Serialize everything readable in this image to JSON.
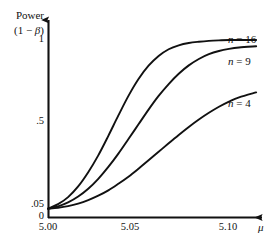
{
  "chart_data": {
    "type": "line",
    "title": "",
    "ylabel": "Power (1 − β)",
    "ylabel_line1": "Power",
    "ylabel_line2_open": "(1 − ",
    "ylabel_line2_var": "β",
    "ylabel_line2_close": ")",
    "xlabel": "μ",
    "xlim": [
      5.0,
      5.1064
    ],
    "ylim": [
      0,
      1.06
    ],
    "grid": false,
    "legend_position": "right-of-curve-ends",
    "yticks": [
      {
        "value": 1,
        "label": "1"
      },
      {
        "value": 0.5,
        "label": ".5"
      },
      {
        "value": 0.05,
        "label": ".05"
      },
      {
        "value": 0,
        "label": "0"
      }
    ],
    "xticks": [
      {
        "value": 5.0,
        "label": "5.00"
      },
      {
        "value": 5.05,
        "label": "5.05"
      },
      {
        "value": 5.1,
        "label": "5.10"
      }
    ],
    "series": [
      {
        "name": "n = 16",
        "label_n": "n",
        "label_eq": "= 16",
        "color": "#111111",
        "points": [
          {
            "x": 5.0,
            "y": 0.05
          },
          {
            "x": 5.005,
            "y": 0.075
          },
          {
            "x": 5.01,
            "y": 0.115
          },
          {
            "x": 5.015,
            "y": 0.175
          },
          {
            "x": 5.02,
            "y": 0.255
          },
          {
            "x": 5.025,
            "y": 0.35
          },
          {
            "x": 5.03,
            "y": 0.46
          },
          {
            "x": 5.035,
            "y": 0.575
          },
          {
            "x": 5.04,
            "y": 0.685
          },
          {
            "x": 5.045,
            "y": 0.78
          },
          {
            "x": 5.05,
            "y": 0.855
          },
          {
            "x": 5.055,
            "y": 0.91
          },
          {
            "x": 5.06,
            "y": 0.948
          },
          {
            "x": 5.065,
            "y": 0.97
          },
          {
            "x": 5.07,
            "y": 0.983
          },
          {
            "x": 5.075,
            "y": 0.99
          },
          {
            "x": 5.08,
            "y": 0.995
          },
          {
            "x": 5.085,
            "y": 0.998
          },
          {
            "x": 5.09,
            "y": 1.0
          },
          {
            "x": 5.1,
            "y": 1.0
          },
          {
            "x": 5.1035,
            "y": 1.0
          }
        ]
      },
      {
        "name": "n = 9",
        "label_n": "n",
        "label_eq": "= 9",
        "color": "#111111",
        "points": [
          {
            "x": 5.0,
            "y": 0.05
          },
          {
            "x": 5.005,
            "y": 0.063
          },
          {
            "x": 5.01,
            "y": 0.085
          },
          {
            "x": 5.015,
            "y": 0.118
          },
          {
            "x": 5.02,
            "y": 0.162
          },
          {
            "x": 5.025,
            "y": 0.218
          },
          {
            "x": 5.03,
            "y": 0.285
          },
          {
            "x": 5.035,
            "y": 0.36
          },
          {
            "x": 5.04,
            "y": 0.442
          },
          {
            "x": 5.045,
            "y": 0.525
          },
          {
            "x": 5.05,
            "y": 0.608
          },
          {
            "x": 5.055,
            "y": 0.685
          },
          {
            "x": 5.06,
            "y": 0.752
          },
          {
            "x": 5.065,
            "y": 0.81
          },
          {
            "x": 5.07,
            "y": 0.857
          },
          {
            "x": 5.075,
            "y": 0.893
          },
          {
            "x": 5.08,
            "y": 0.92
          },
          {
            "x": 5.085,
            "y": 0.938
          },
          {
            "x": 5.09,
            "y": 0.95
          },
          {
            "x": 5.095,
            "y": 0.958
          },
          {
            "x": 5.1035,
            "y": 0.965
          }
        ]
      },
      {
        "name": "n = 4",
        "label_n": "n",
        "label_eq": "= 4",
        "color": "#111111",
        "points": [
          {
            "x": 5.0,
            "y": 0.05
          },
          {
            "x": 5.005,
            "y": 0.055
          },
          {
            "x": 5.01,
            "y": 0.064
          },
          {
            "x": 5.015,
            "y": 0.078
          },
          {
            "x": 5.02,
            "y": 0.098
          },
          {
            "x": 5.025,
            "y": 0.123
          },
          {
            "x": 5.03,
            "y": 0.153
          },
          {
            "x": 5.035,
            "y": 0.19
          },
          {
            "x": 5.04,
            "y": 0.23
          },
          {
            "x": 5.045,
            "y": 0.275
          },
          {
            "x": 5.05,
            "y": 0.322
          },
          {
            "x": 5.055,
            "y": 0.37
          },
          {
            "x": 5.06,
            "y": 0.418
          },
          {
            "x": 5.065,
            "y": 0.465
          },
          {
            "x": 5.07,
            "y": 0.51
          },
          {
            "x": 5.075,
            "y": 0.552
          },
          {
            "x": 5.08,
            "y": 0.59
          },
          {
            "x": 5.085,
            "y": 0.624
          },
          {
            "x": 5.09,
            "y": 0.653
          },
          {
            "x": 5.095,
            "y": 0.677
          },
          {
            "x": 5.1035,
            "y": 0.705
          }
        ]
      }
    ]
  }
}
